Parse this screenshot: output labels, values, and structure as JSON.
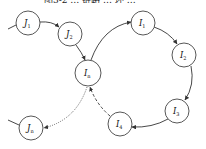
{
  "caption": "图3-2 … 链路 … 环 …",
  "nodes": [
    {
      "id": "J1",
      "base": "J",
      "sub": "1",
      "cx": 28,
      "cy": 23,
      "r": 12
    },
    {
      "id": "J2",
      "base": "J",
      "sub": "2",
      "cx": 70,
      "cy": 34,
      "r": 12
    },
    {
      "id": "In",
      "base": "I",
      "sub": "n",
      "cx": 88,
      "cy": 73,
      "r": 13
    },
    {
      "id": "I1",
      "base": "I",
      "sub": "1",
      "cx": 143,
      "cy": 23,
      "r": 12
    },
    {
      "id": "I2",
      "base": "I",
      "sub": "2",
      "cx": 184,
      "cy": 55,
      "r": 12
    },
    {
      "id": "I3",
      "base": "I",
      "sub": "3",
      "cx": 177,
      "cy": 111,
      "r": 12
    },
    {
      "id": "I4",
      "base": "I",
      "sub": "4",
      "cx": 120,
      "cy": 124,
      "r": 12
    },
    {
      "id": "Jn",
      "base": "J",
      "sub": "n",
      "cx": 31,
      "cy": 128,
      "r": 12
    }
  ],
  "edges": [
    {
      "from": "external",
      "to": "J1",
      "style": "solid"
    },
    {
      "from": "J1",
      "to": "J2",
      "style": "solid",
      "arrow": true
    },
    {
      "from": "J2",
      "to": "In",
      "style": "solid",
      "arrow": true
    },
    {
      "from": "In",
      "to": "I1",
      "style": "solid",
      "arrow": true
    },
    {
      "from": "I1",
      "to": "I2",
      "style": "solid",
      "arrow": true
    },
    {
      "from": "I2",
      "to": "I3",
      "style": "solid",
      "arrow": true
    },
    {
      "from": "I3",
      "to": "I4",
      "style": "solid",
      "arrow": true
    },
    {
      "from": "I4",
      "to": "In",
      "style": "dashed",
      "arrow": true
    },
    {
      "from": "In",
      "to": "Jn",
      "style": "dotted",
      "arrow": true
    },
    {
      "from": "external",
      "to": "Jn",
      "style": "solid"
    }
  ],
  "colors": {
    "stroke": "#333333",
    "background": "#ffffff"
  }
}
